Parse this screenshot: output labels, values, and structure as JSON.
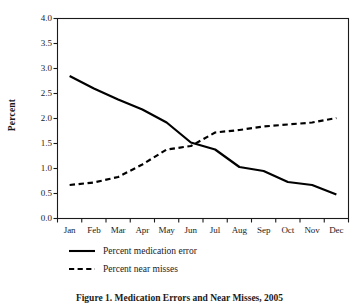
{
  "chart_data": {
    "type": "line",
    "title": "",
    "xlabel": "",
    "ylabel": "Percent",
    "categories": [
      "Jan",
      "Feb",
      "Mar",
      "Apr",
      "May",
      "Jun",
      "Jul",
      "Aug",
      "Sep",
      "Oct",
      "Nov",
      "Dec"
    ],
    "ylim": [
      0.0,
      4.0
    ],
    "yticks": [
      "0.0",
      "0.5",
      "1.0",
      "1.5",
      "2.0",
      "2.5",
      "3.0",
      "3.5",
      "4.0"
    ],
    "ytick_values": [
      0.0,
      0.5,
      1.0,
      1.5,
      2.0,
      2.5,
      3.0,
      3.5,
      4.0
    ],
    "grid": false,
    "legend_position": "below-left",
    "series": [
      {
        "name": "Percent medication error",
        "style": "solid",
        "color": "#000000",
        "values": [
          2.85,
          2.6,
          2.38,
          2.18,
          1.92,
          1.52,
          1.38,
          1.03,
          0.95,
          0.73,
          0.67,
          0.48
        ]
      },
      {
        "name": "Percent near misses",
        "style": "dashed",
        "color": "#000000",
        "values": [
          0.67,
          0.72,
          0.83,
          1.08,
          1.38,
          1.45,
          1.72,
          1.77,
          1.84,
          1.88,
          1.92,
          2.01
        ]
      }
    ]
  },
  "legend": {
    "items": [
      {
        "label": "Percent medication error",
        "style": "solid"
      },
      {
        "label": "Percent near misses",
        "style": "dashed"
      }
    ]
  },
  "caption": {
    "text": "Figure 1. Medication Errors and Near Misses, 2005"
  },
  "colors": {
    "line": "#000000",
    "axis": "#1a1a1a",
    "background": "#ffffff"
  }
}
